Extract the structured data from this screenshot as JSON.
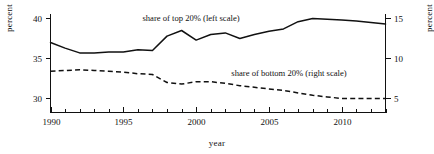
{
  "chart_data": {
    "type": "line",
    "title": "",
    "xlabel": "year",
    "ylabel": "percent",
    "ylabel_right": "percent",
    "xlim": [
      1990,
      2013
    ],
    "ylim": [
      29.2,
      40.8
    ],
    "ylim_right": [
      4.3,
      15.7
    ],
    "grid": false,
    "legend_position": "inline-annotation",
    "x": [
      1990,
      1991,
      1992,
      1993,
      1994,
      1995,
      1996,
      1997,
      1998,
      1999,
      2000,
      2001,
      2002,
      2003,
      2004,
      2005,
      2006,
      2007,
      2008,
      2009,
      2010,
      2011,
      2012,
      2013
    ],
    "xticks": [
      1990,
      1995,
      2000,
      2005,
      2010
    ],
    "xtick_labels": [
      "1990",
      "1995",
      "2000",
      "2005",
      "2010"
    ],
    "xminor_step": 1,
    "yticks_left": [
      30,
      35,
      40
    ],
    "ytick_labels_left": [
      "30",
      "35",
      "40"
    ],
    "yticks_right": [
      5,
      10,
      15
    ],
    "ytick_labels_right": [
      "5",
      "10",
      "15"
    ],
    "series": [
      {
        "name": "share of top 20% (left scale)",
        "axis": "left",
        "style": "solid",
        "color": "#111111",
        "values": [
          37.0,
          36.3,
          35.7,
          35.7,
          35.8,
          35.8,
          36.1,
          36.0,
          37.8,
          38.5,
          37.3,
          38.0,
          38.2,
          37.5,
          38.0,
          38.4,
          38.7,
          39.6,
          40.0,
          39.9,
          39.8,
          39.7,
          39.5,
          39.3
        ]
      },
      {
        "name": "share of bottom 20% (right scale)",
        "axis": "right",
        "style": "dashed",
        "color": "#111111",
        "values": [
          8.4,
          8.5,
          8.6,
          8.5,
          8.4,
          8.3,
          8.1,
          8.0,
          7.0,
          6.8,
          7.1,
          7.1,
          6.9,
          6.6,
          6.4,
          6.2,
          6.0,
          5.7,
          5.4,
          5.2,
          5.0,
          5.0,
          5.0,
          5.0
        ]
      }
    ],
    "annotations": [
      {
        "text": "share of top 20% (left scale)",
        "x": 1999.2,
        "anchor": "middle",
        "px": 191,
        "py": 21
      },
      {
        "text": "share of bottom 20% (right scale)",
        "x": 2005.4,
        "anchor": "middle",
        "px": 289,
        "py": 76
      }
    ]
  },
  "axes": {
    "left_title": "percent",
    "right_title": "percent",
    "x_title": "year"
  }
}
